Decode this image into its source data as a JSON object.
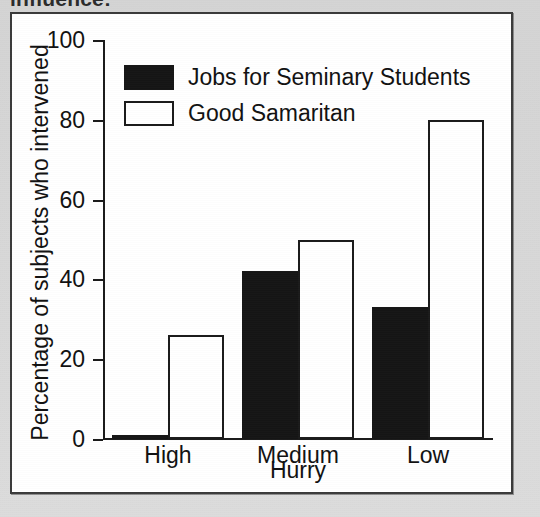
{
  "scan": {
    "cropped_top_text": "influence:"
  },
  "chart_data": {
    "type": "bar",
    "title": "",
    "categories": [
      "High",
      "Medium",
      "Low"
    ],
    "series": [
      {
        "name": "Jobs for Seminary Students",
        "color": "#151515",
        "fill": "solid",
        "values": [
          1,
          42,
          33
        ]
      },
      {
        "name": "Good Samaritan",
        "color": "#ffffff",
        "fill": "outline",
        "values": [
          26,
          50,
          80
        ]
      }
    ],
    "xlabel": "Hurry",
    "ylabel": "Percentage of subjects who intervened",
    "ylim": [
      0,
      100
    ],
    "yticks": [
      0,
      20,
      40,
      60,
      80,
      100
    ],
    "ytick_labels": [
      "0",
      "20",
      "40",
      "60",
      "80",
      "100"
    ],
    "grid": false,
    "legend_position": "upper-left-inside"
  }
}
